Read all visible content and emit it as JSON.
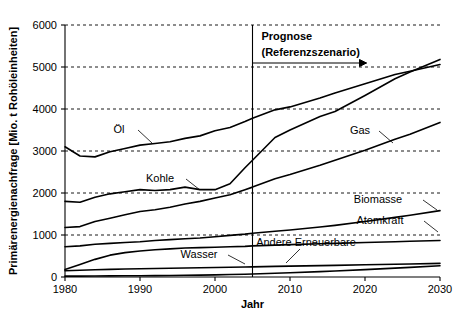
{
  "chart_data": {
    "type": "line",
    "title": "",
    "xlabel": "Jahr",
    "ylabel": "Primärenergienachfrage [Mio. t Rohöleinheiten]",
    "xlim": [
      1980,
      2030
    ],
    "ylim": [
      0,
      6000
    ],
    "grid": true,
    "legend_position": "inline-labels",
    "xticks": [
      1980,
      1990,
      2000,
      2010,
      2020,
      2030
    ],
    "yticks": [
      0,
      1000,
      2000,
      3000,
      4000,
      5000,
      6000
    ],
    "annotations": [
      {
        "name": "prognose",
        "line1": "Prognose",
        "line2": "(Referenzszenario)",
        "x": 2005,
        "marker": "vertical-line-with-arrow"
      }
    ],
    "x": [
      1980,
      1982,
      1984,
      1986,
      1988,
      1990,
      1992,
      1994,
      1996,
      1998,
      2000,
      2002,
      2004,
      2005,
      2008,
      2010,
      2014,
      2016,
      2020,
      2024,
      2026,
      2030
    ],
    "series": [
      {
        "name": "Öl",
        "label": "Öl",
        "label_x": 119,
        "label_y": 133,
        "values": [
          3100,
          2880,
          2860,
          2980,
          3060,
          3140,
          3180,
          3220,
          3300,
          3360,
          3480,
          3560,
          3700,
          3780,
          3980,
          4050,
          4260,
          4380,
          4600,
          4820,
          4900,
          5060
        ]
      },
      {
        "name": "Kohle",
        "label": "Kohle",
        "label_x": 160,
        "label_y": 182,
        "values": [
          1800,
          1780,
          1900,
          1980,
          2030,
          2080,
          2060,
          2080,
          2140,
          2080,
          2080,
          2220,
          2600,
          2780,
          3320,
          3500,
          3820,
          3940,
          4320,
          4720,
          4880,
          5180
        ]
      },
      {
        "name": "Gas",
        "label": "Gas",
        "label_x": 360,
        "label_y": 134,
        "values": [
          1180,
          1200,
          1320,
          1400,
          1480,
          1560,
          1600,
          1660,
          1740,
          1800,
          1880,
          1960,
          2080,
          2140,
          2340,
          2440,
          2660,
          2780,
          3020,
          3280,
          3400,
          3680
        ]
      },
      {
        "name": "Biomasse",
        "label": "Biomasse",
        "label_x": 378,
        "label_y": 203,
        "values": [
          720,
          740,
          780,
          800,
          820,
          840,
          870,
          890,
          910,
          930,
          960,
          990,
          1020,
          1040,
          1090,
          1120,
          1190,
          1230,
          1320,
          1420,
          1470,
          1580
        ]
      },
      {
        "name": "Atomkraft",
        "label": "Atomkraft",
        "label_x": 380,
        "label_y": 224,
        "values": [
          180,
          300,
          420,
          520,
          580,
          620,
          650,
          670,
          690,
          700,
          710,
          720,
          730,
          740,
          760,
          770,
          790,
          800,
          820,
          840,
          850,
          870
        ]
      },
      {
        "name": "Wasser",
        "label": "Wasser",
        "label_x": 199,
        "label_y": 258,
        "values": [
          150,
          160,
          172,
          182,
          190,
          196,
          202,
          208,
          214,
          220,
          226,
          232,
          238,
          242,
          252,
          258,
          270,
          276,
          290,
          304,
          310,
          324
        ]
      },
      {
        "name": "Andere Erneuerbare",
        "label": "Andere Erneuerbare",
        "label_x": 306,
        "label_y": 246,
        "values": [
          20,
          22,
          24,
          26,
          28,
          30,
          32,
          36,
          40,
          44,
          50,
          58,
          66,
          72,
          90,
          102,
          128,
          142,
          176,
          212,
          230,
          268
        ]
      }
    ]
  }
}
